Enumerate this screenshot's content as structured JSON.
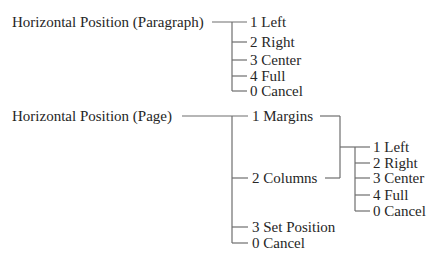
{
  "diagram": {
    "paragraph": {
      "root": "Horizontal Position (Paragraph)",
      "options": [
        "1 Left",
        "2 Right",
        "3 Center",
        "4 Full",
        "0 Cancel"
      ]
    },
    "page": {
      "root": "Horizontal Position (Page)",
      "options": [
        "1 Margins",
        "2 Columns",
        "3 Set Position",
        "0 Cancel"
      ],
      "sub_options": [
        "1 Left",
        "2 Right",
        "3 Center",
        "4 Full",
        "0 Cancel"
      ]
    }
  },
  "colors": {
    "text": "#262626",
    "lines": "#6e6e6e",
    "background": "#ffffff"
  }
}
